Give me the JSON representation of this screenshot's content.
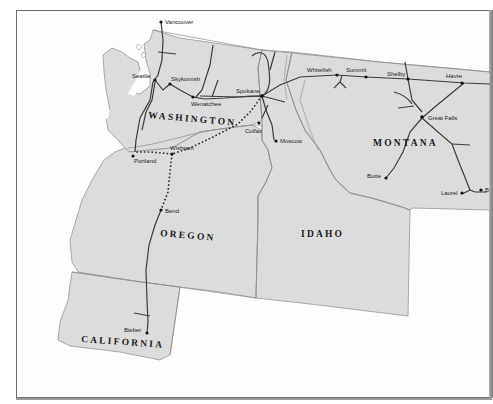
{
  "map": {
    "states": [
      {
        "id": "washington",
        "label": "WASHINGTON"
      },
      {
        "id": "oregon",
        "label": "OREGON"
      },
      {
        "id": "idaho",
        "label": "IDAHO"
      },
      {
        "id": "montana",
        "label": "MONTANA"
      },
      {
        "id": "california",
        "label": "CALIFORNIA"
      }
    ],
    "cities": [
      {
        "id": "vancouver",
        "label": "Vancouver"
      },
      {
        "id": "seattle",
        "label": "Seattle"
      },
      {
        "id": "skykomish",
        "label": "Skykomish"
      },
      {
        "id": "wenatchee",
        "label": "Wenatchee"
      },
      {
        "id": "spokane",
        "label": "Spokane"
      },
      {
        "id": "colfax",
        "label": "Colfax"
      },
      {
        "id": "moscow",
        "label": "Moscow"
      },
      {
        "id": "portland",
        "label": "Portland"
      },
      {
        "id": "wishram",
        "label": "Wishram"
      },
      {
        "id": "bend",
        "label": "Bend"
      },
      {
        "id": "bieber",
        "label": "Bieber"
      },
      {
        "id": "whitefish",
        "label": "Whitefish"
      },
      {
        "id": "summit",
        "label": "Summit"
      },
      {
        "id": "shelby",
        "label": "Shelby"
      },
      {
        "id": "havre",
        "label": "Havre"
      },
      {
        "id": "great-falls",
        "label": "Great Falls"
      },
      {
        "id": "butte",
        "label": "Butte"
      },
      {
        "id": "laurel",
        "label": "Laurel"
      },
      {
        "id": "billings-cut",
        "label": "B"
      }
    ],
    "colors": {
      "land": "#dcdcdc",
      "background": "#fdfdfd",
      "rail": "#3c3c3c",
      "border": "#8d8d8d"
    }
  }
}
